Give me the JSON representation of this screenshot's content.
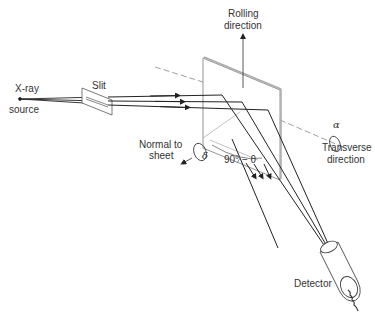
{
  "diagram": {
    "type": "x-ray pole figure diffraction geometry",
    "labels": {
      "xray_source_line1": "X-ray",
      "xray_source_line2": "source",
      "slit": "Slit",
      "rolling_line1": "Rolling",
      "rolling_line2": "direction",
      "normal_line1": "Normal to",
      "normal_line2": "sheet",
      "delta": "δ",
      "angle": "90° − θ",
      "alpha": "α",
      "transverse_line1": "Transverse",
      "transverse_line2": "direction",
      "detector": "Detector"
    },
    "colors": {
      "line": "#222222",
      "sheet_edge": "#888888",
      "axis": "#777777",
      "text": "#333333"
    }
  }
}
